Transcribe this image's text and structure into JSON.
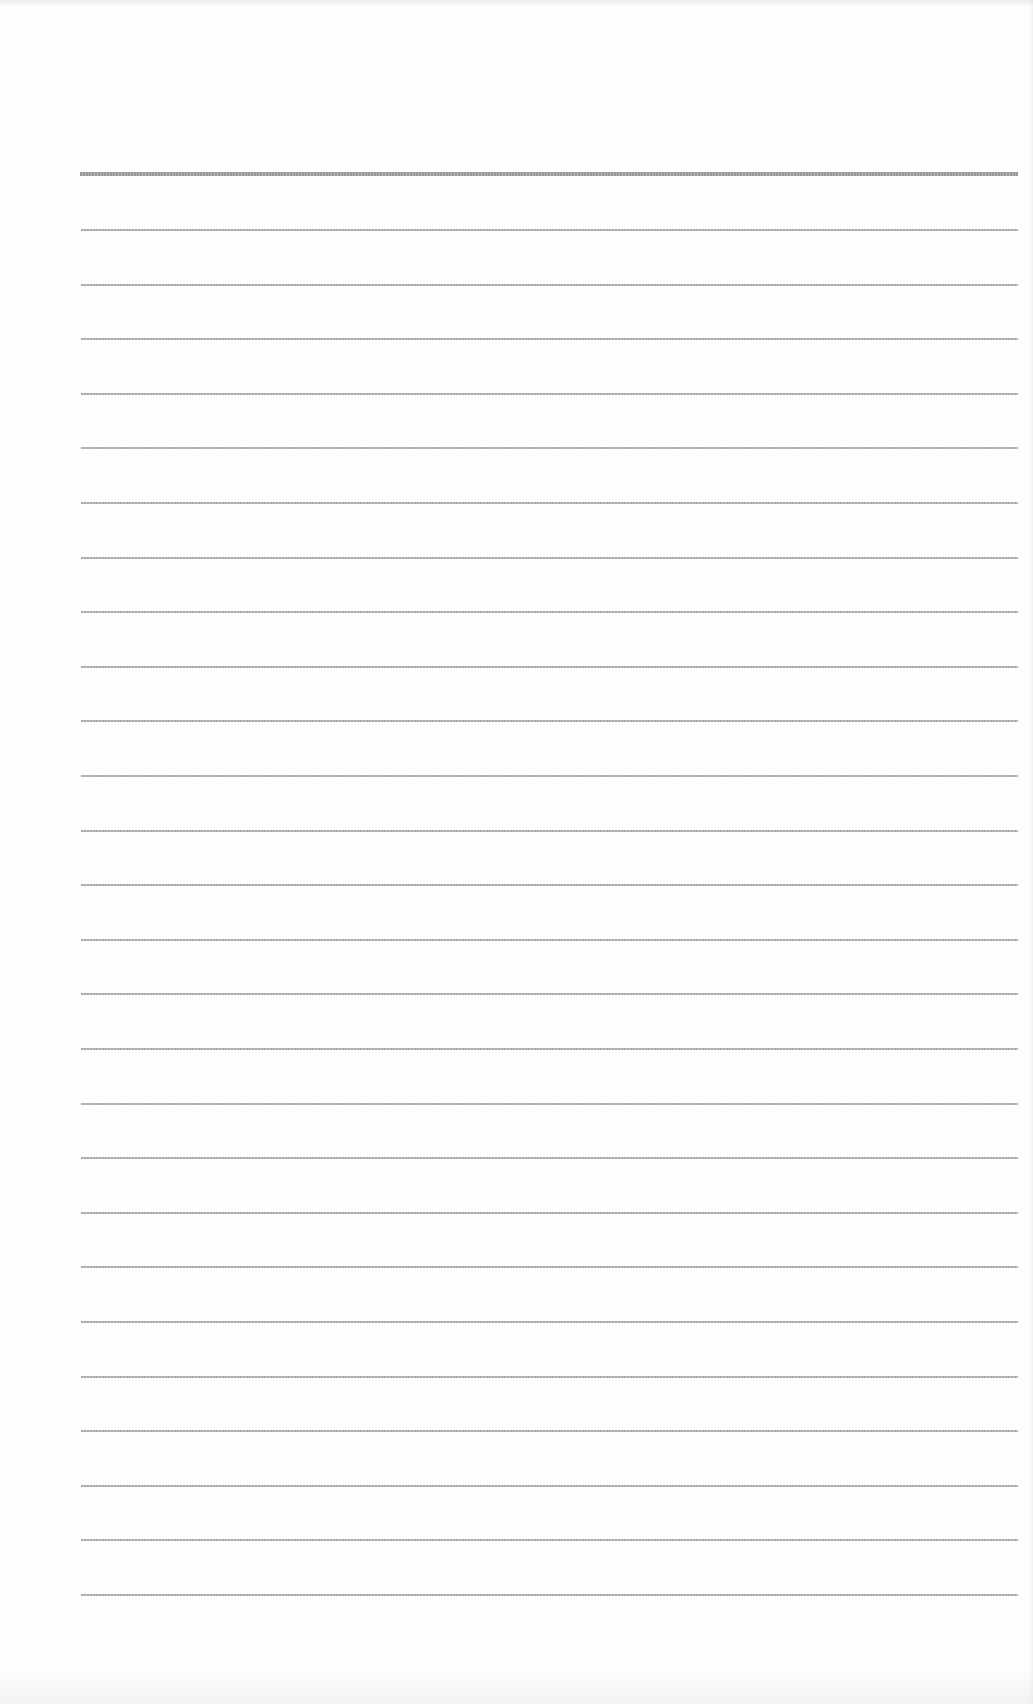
{
  "page": {
    "type": "blank lined paper",
    "background_color": "#fefefe",
    "line_color": "#a8a8a8",
    "header_rule_color": "#9a9a9a"
  },
  "header_rule": {
    "y": 172,
    "thickness": 4
  },
  "ruled_lines": {
    "count": 26,
    "first_y": 229,
    "spacing": 54.6,
    "left": 81,
    "right": 1018
  }
}
